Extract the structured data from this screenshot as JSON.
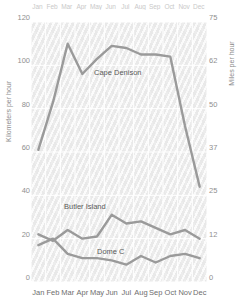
{
  "chart_data": {
    "type": "line",
    "title": "",
    "xlabel": "",
    "ylabel": "Kilometers per hour",
    "ylabel_right": "Miles per hour",
    "grid": true,
    "legend_position": "inline-labels",
    "categories": [
      "Jan",
      "Feb",
      "Mar",
      "Apr",
      "May",
      "Jun",
      "Jul",
      "Aug",
      "Sep",
      "Oct",
      "Nov",
      "Dec"
    ],
    "x": [
      "Jan",
      "Feb",
      "Mar",
      "Apr",
      "May",
      "Jun",
      "Jul",
      "Aug",
      "Sep",
      "Oct",
      "Nov",
      "Dec"
    ],
    "ylim": [
      0,
      120
    ],
    "yticks": [
      "0",
      "20",
      "40",
      "60",
      "80",
      "100",
      "120"
    ],
    "ylim_right": [
      0,
      75
    ],
    "yticks_right": [
      "0",
      "12",
      "25",
      "37",
      "50",
      "62",
      "75"
    ],
    "series": [
      {
        "name": "Cape Denison",
        "color": "#9a9a9a",
        "values": [
          61,
          83,
          110,
          96,
          103,
          109,
          108,
          105,
          105,
          104,
          72,
          44
        ]
      },
      {
        "name": "Butler Island",
        "color": "#9a9a9a",
        "values": [
          22,
          19,
          24,
          20,
          21,
          31,
          27,
          28,
          25,
          22,
          24,
          20
        ]
      },
      {
        "name": "Dome C",
        "color": "#9a9a9a",
        "values": [
          17,
          20,
          13,
          11,
          11,
          10,
          8,
          12,
          9,
          12,
          13,
          11
        ]
      }
    ]
  },
  "axes": {
    "left_title": "Kilometers per hour",
    "right_title": "Miles per hour",
    "left_ticks": [
      "120",
      "100",
      "80",
      "60",
      "40",
      "20",
      "0"
    ],
    "right_ticks": [
      "75",
      "62",
      "50",
      "37",
      "25",
      "12",
      "0"
    ]
  },
  "months": {
    "top": [
      "Jan",
      "Feb",
      "Mar",
      "Apr",
      "May",
      "Jun",
      "Jul",
      "Aug",
      "Sep",
      "Oct",
      "Nov",
      "Dec"
    ],
    "bottom": [
      "Jan",
      "Feb",
      "Mar",
      "Apr",
      "May",
      "Jun",
      "Jul",
      "Aug",
      "Sep",
      "Oct",
      "Nov",
      "Dec"
    ]
  },
  "labels": {
    "cape_denison": "Cape Denison",
    "butler_island": "Butler Island",
    "dome_c": "Dome C"
  },
  "colors": {
    "line": "#9a9a9a",
    "plot_background": "#f2f2f2",
    "grid": "#ffffff",
    "tick_text": "#8f8f8f",
    "label_text": "#5a5a5a"
  }
}
